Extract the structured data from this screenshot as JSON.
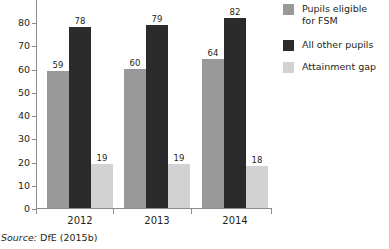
{
  "chart_data": {
    "type": "bar",
    "title": "",
    "subtitle": "",
    "xlabel": "",
    "ylabel": "",
    "categories": [
      "2012",
      "2013",
      "2014"
    ],
    "series": [
      {
        "name": "Pupils eligible\nfor FSM",
        "color": "#999999",
        "values": [
          59,
          60,
          64
        ]
      },
      {
        "name": "All other pupils",
        "color": "#2b2b2b",
        "values": [
          78,
          79,
          82
        ]
      },
      {
        "name": "Attainment gap",
        "color": "#d2d2d2",
        "values": [
          19,
          19,
          18
        ]
      }
    ],
    "ylim": [
      0,
      90
    ],
    "yticks": [
      0,
      10,
      20,
      30,
      40,
      50,
      60,
      70,
      80
    ],
    "ytick_labels": [
      "0",
      "10",
      "20",
      "30",
      "40",
      "50",
      "60",
      "70",
      "80"
    ],
    "grid": false,
    "legend_position": "right",
    "value_labels": true
  },
  "legend": {
    "entries": [
      {
        "label": "Pupils eligible\nfor FSM",
        "color": "#999999"
      },
      {
        "label": "All other pupils",
        "color": "#2b2b2b"
      },
      {
        "label": "Attainment gap",
        "color": "#d2d2d2"
      }
    ]
  },
  "source_note": {
    "keyword": "Source:",
    "text": " DfE (2015b)"
  },
  "colors": {
    "axis": "#8c8c8c",
    "text": "#231f20",
    "background": "#ffffff",
    "series_fsm": "#999999",
    "series_other": "#2b2b2b",
    "series_gap": "#d2d2d2"
  }
}
